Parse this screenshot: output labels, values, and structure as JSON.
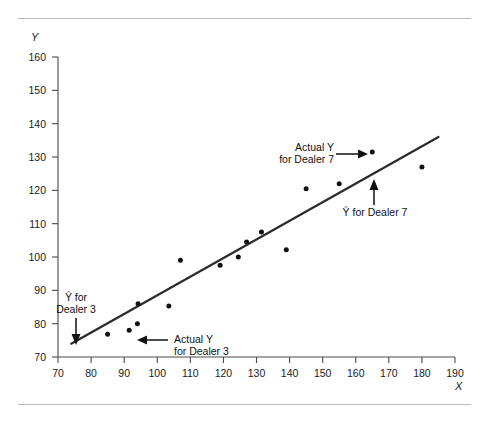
{
  "figure": {
    "y_axis_title": "Y",
    "x_axis_title": "X"
  },
  "annotations": {
    "actual_y_dealer7_line1": "Actual Y",
    "actual_y_dealer7_line2": "for Dealer 7",
    "fitted_y_dealer7": "Ŷ for Dealer 7",
    "fitted_y_dealer3_line1": "Ŷ for",
    "fitted_y_dealer3_line2": "Dealer 3",
    "actual_y_dealer3_line1": "Actual Y",
    "actual_y_dealer3_line2": "for Dealer 3"
  },
  "chart_data": {
    "type": "scatter",
    "title": "",
    "xlabel": "X",
    "ylabel": "Y",
    "xlim": [
      70,
      190
    ],
    "ylim": [
      70,
      160
    ],
    "grid": false,
    "legend": null,
    "xticks": [
      70,
      80,
      90,
      100,
      110,
      120,
      130,
      140,
      150,
      160,
      170,
      180,
      190
    ],
    "yticks": [
      70,
      80,
      90,
      100,
      110,
      120,
      130,
      140,
      150,
      160
    ],
    "xtick_labels": [
      "70",
      "80",
      "90",
      "100",
      "110",
      "120",
      "130",
      "140",
      "150",
      "160",
      "170",
      "180",
      "190"
    ],
    "ytick_labels": [
      "70",
      "80",
      "90",
      "100",
      "110",
      "120",
      "130",
      "140",
      "150",
      "160"
    ],
    "points": [
      {
        "x": 85.0,
        "y": 76.8
      },
      {
        "x": 91.5,
        "y": 78.0
      },
      {
        "x": 94.0,
        "y": 80.0
      },
      {
        "x": 94.2,
        "y": 86.0
      },
      {
        "x": 103.5,
        "y": 85.3
      },
      {
        "x": 107.0,
        "y": 99.0
      },
      {
        "x": 119.0,
        "y": 97.5
      },
      {
        "x": 124.5,
        "y": 100.0
      },
      {
        "x": 127.0,
        "y": 104.5
      },
      {
        "x": 131.5,
        "y": 107.5
      },
      {
        "x": 139.0,
        "y": 102.2
      },
      {
        "x": 145.0,
        "y": 120.5
      },
      {
        "x": 155.0,
        "y": 122.0
      },
      {
        "x": 165.0,
        "y": 131.5
      },
      {
        "x": 180.0,
        "y": 127.0
      }
    ],
    "fit_line": {
      "label": "regression line",
      "x_start": 74.0,
      "y_start": 74.0,
      "x_end": 185.0,
      "y_end": 136.0
    },
    "callouts": [
      {
        "name": "actual-y-dealer-7",
        "text": "Actual Y for Dealer 7",
        "points_to": {
          "x": 165.0,
          "y": 131.5
        },
        "arrow_direction": "right"
      },
      {
        "name": "fitted-y-dealer-7",
        "text": "Ŷ for Dealer 7",
        "points_to": {
          "x": 161.0,
          "y": 117.0
        },
        "arrow_direction": "up"
      },
      {
        "name": "fitted-y-dealer-3",
        "text": "Ŷ for Dealer 3",
        "points_to": {
          "x": 79.0,
          "y": 77.0
        },
        "arrow_direction": "down"
      },
      {
        "name": "actual-y-dealer-3",
        "text": "Actual Y for Dealer 3",
        "points_to": {
          "x": 94.0,
          "y": 80.0
        },
        "arrow_direction": "left"
      }
    ]
  }
}
